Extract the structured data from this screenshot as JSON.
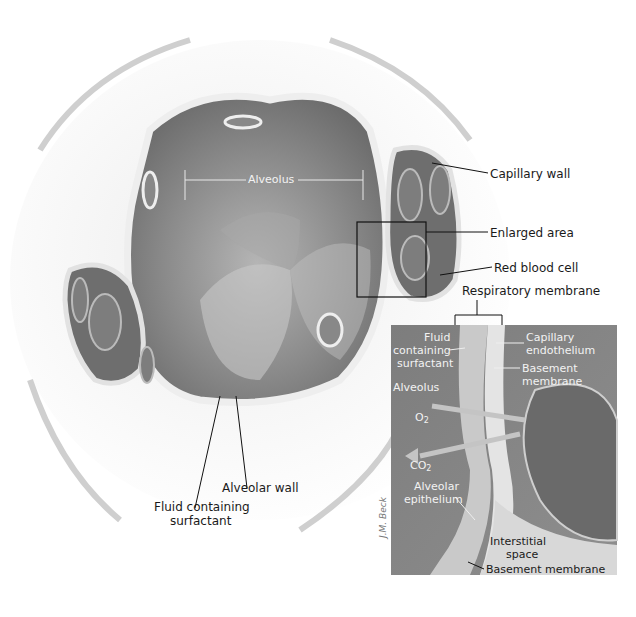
{
  "figure": {
    "main_view": {
      "alveolus_label": "Alveolus",
      "labels": {
        "capillary_wall": "Capillary wall",
        "enlarged_area": "Enlarged area",
        "red_blood_cell": "Red blood cell",
        "respiratory_membrane": "Respiratory membrane",
        "alveolar_wall": "Alveolar wall",
        "fluid_surfactant_line1": "Fluid containing",
        "fluid_surfactant_line2": "surfactant"
      }
    },
    "inset": {
      "fluid_line1": "Fluid",
      "fluid_line2": "containing",
      "fluid_line3": "surfactant",
      "alveolus": "Alveolus",
      "o2": "O",
      "o2_sub": "2",
      "co2": "CO",
      "co2_sub": "2",
      "alveolar_epithelium_line1": "Alveolar",
      "alveolar_epithelium_line2": "epithelium",
      "capillary_endothelium_line1": "Capillary",
      "capillary_endothelium_line2": "endothelium",
      "basement_membrane_top_line1": "Basement",
      "basement_membrane_top_line2": "membrane",
      "interstitial_line1": "Interstitial",
      "interstitial_line2": "space",
      "basement_membrane_bottom": "Basement membrane",
      "signature": "J.M. Beck"
    },
    "colors": {
      "alveolus_fill": "#7a7a7a",
      "capillary_fill": "#6a6a6a",
      "tissue": "#e6e6e6",
      "inset_bg": "#8a8a8a",
      "label_text": "#1a1a1a"
    }
  }
}
